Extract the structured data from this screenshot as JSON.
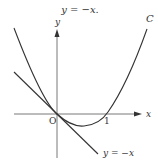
{
  "caption": "y = −x.",
  "diagram": {
    "curve_label": "C",
    "x_axis_label": "x",
    "y_axis_label": "y",
    "origin_label": "O",
    "tick_label_1": "1",
    "line_label": "y = −x",
    "colors": {
      "stroke": "#333333",
      "axis": "#555555"
    }
  }
}
